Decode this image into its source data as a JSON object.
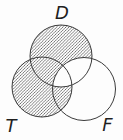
{
  "figure": {
    "type": "venn-diagram",
    "background_color": "#fdfdfd",
    "outline_color": "#3b3b3b",
    "outline_width": 1,
    "label_color": "#1f1f1f",
    "hatch": {
      "color": "#575757",
      "line_width": 0.75,
      "tile": 3.1,
      "direction": "diagonal-up"
    },
    "circles": [
      {
        "name": "D",
        "cx": 61,
        "cy": 56,
        "r": 31
      },
      {
        "name": "T",
        "cx": 42,
        "cy": 87,
        "r": 30
      },
      {
        "name": "F",
        "cx": 84,
        "cy": 89,
        "r": 31.5
      }
    ],
    "labels": [
      {
        "text": "D",
        "x": 62,
        "y": 19
      },
      {
        "text": "T",
        "x": 11,
        "y": 132
      },
      {
        "text": "F",
        "x": 107.5,
        "y": 131
      }
    ],
    "shaded_regions": [
      {
        "id": "D-minus-F",
        "description": "inside circle D but outside circle F (includes D∩T outside F)"
      },
      {
        "id": "T-minus-D",
        "description": "inside circle T but outside circle D (includes T∩F outside D)"
      }
    ],
    "unshaded_regions": [
      "D∩F outside T",
      "D∩T∩F",
      "F only"
    ]
  }
}
